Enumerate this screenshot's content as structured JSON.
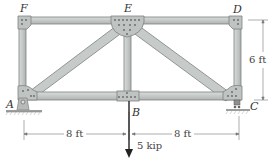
{
  "diagram": {
    "type": "truss",
    "nodes": {
      "F": {
        "label": "F",
        "x": 22,
        "y": 20
      },
      "E": {
        "label": "E",
        "x": 127,
        "y": 20
      },
      "D": {
        "label": "D",
        "x": 237,
        "y": 20
      },
      "A": {
        "label": "A",
        "x": 22,
        "y": 97
      },
      "B": {
        "label": "B",
        "x": 127,
        "y": 97
      },
      "C": {
        "label": "C",
        "x": 237,
        "y": 97
      }
    },
    "members": [
      "FE",
      "ED",
      "AB",
      "BC",
      "AF",
      "CD",
      "BE",
      "AE",
      "EC"
    ],
    "supports": {
      "A": "pin",
      "C": "roller"
    },
    "load": {
      "node": "B",
      "label": "5 kip",
      "direction": "down"
    },
    "dimensions": {
      "left_span": "8 ft",
      "right_span": "8 ft",
      "height": "6 ft"
    },
    "colors": {
      "member_fill": "#c9cccb",
      "member_edge": "#7d8280",
      "plate_fill": "#bfc3c1",
      "dim_line": "#666666",
      "load_arrow": "#333333"
    }
  }
}
